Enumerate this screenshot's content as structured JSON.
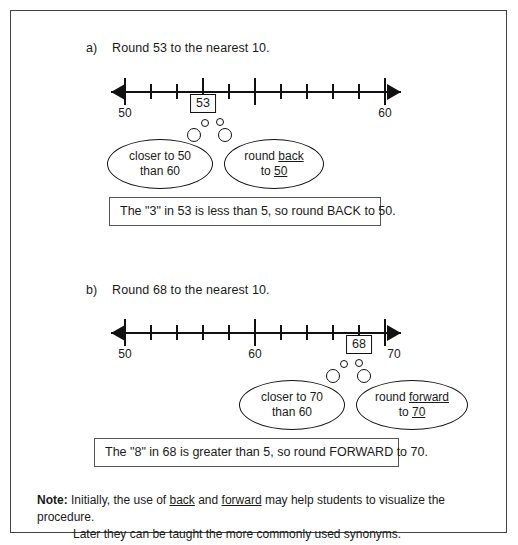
{
  "problems": [
    {
      "label": "a)",
      "prompt": "Round 53 to the nearest 10.",
      "number_line": {
        "start": 50,
        "end": 60,
        "tick_labels": [
          "50",
          "60"
        ],
        "marked_value": "53"
      },
      "bubbles": [
        {
          "line1": "closer to 50",
          "line2": "than 60"
        },
        {
          "line1_pre": "round ",
          "line1_underline": "back",
          "line2_pre": "to ",
          "line2_underline": "50"
        }
      ],
      "statement": "The \"3\" in 53 is less than 5, so round BACK to 50."
    },
    {
      "label": "b)",
      "prompt": "Round 68 to the nearest 10.",
      "number_line": {
        "start": 50,
        "end": 70,
        "tick_labels": [
          "50",
          "60",
          "70"
        ],
        "marked_value": "68"
      },
      "bubbles": [
        {
          "line1": "closer to 70",
          "line2": "than 60"
        },
        {
          "line1_pre": "round ",
          "line1_underline": "forward",
          "line2_pre": "to ",
          "line2_underline": "70"
        }
      ],
      "statement": "The \"8\" in 68 is greater than 5, so round FORWARD to 70."
    }
  ],
  "note": {
    "title": "Note:",
    "line1_pre": "Initially, the use of ",
    "line1_u1": "back",
    "line1_mid": " and ",
    "line1_u2": "forward",
    "line1_post": " may help students to visualize the procedure.",
    "line2": "Later they can be taught the more commonly used synonyms."
  },
  "colors": {
    "ink": "#1a1a1a",
    "line": "#111111",
    "border": "#444444"
  }
}
